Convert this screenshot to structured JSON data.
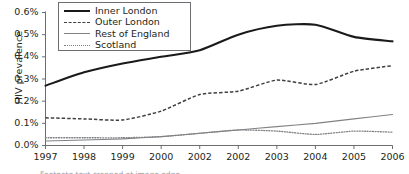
{
  "chart_data": {
    "type": "line",
    "title": "",
    "xlabel": "",
    "ylabel": "HIV prevalence",
    "x": [
      "1997",
      "1998",
      "1999",
      "2000",
      "2002",
      "2002",
      "2003",
      "2004",
      "2005",
      "2006"
    ],
    "xtick_labels": [
      "1997",
      "1998",
      "1999",
      "2000",
      "2002",
      "2002",
      "2003",
      "2004",
      "2005",
      "2006"
    ],
    "ytick_labels": [
      "0.0%",
      "0.1%",
      "0.2%",
      "0.3%",
      "0.4%",
      "0.5%",
      "0.6%"
    ],
    "ytick_values": [
      0.0,
      0.1,
      0.2,
      0.3,
      0.4,
      0.5,
      0.6
    ],
    "ylim": [
      0.0,
      0.6
    ],
    "yunit": "%",
    "grid": false,
    "legend_position": "top-left",
    "series": [
      {
        "name": "Inner London",
        "style": "solid-thick",
        "color": "#1a1a1a",
        "values": [
          0.27,
          0.33,
          0.37,
          0.4,
          0.43,
          0.5,
          0.54,
          0.545,
          0.49,
          0.47
        ]
      },
      {
        "name": "Outer London",
        "style": "dashed",
        "color": "#3f3f3f",
        "values": [
          0.125,
          0.12,
          0.115,
          0.155,
          0.23,
          0.245,
          0.295,
          0.275,
          0.335,
          0.36
        ]
      },
      {
        "name": "Rest of England",
        "style": "solid-thin",
        "color": "#808285",
        "values": [
          0.02,
          0.025,
          0.03,
          0.04,
          0.055,
          0.07,
          0.085,
          0.1,
          0.12,
          0.14
        ]
      },
      {
        "name": "Scotland",
        "style": "dotted",
        "color": "#808285",
        "values": [
          0.035,
          0.035,
          0.035,
          0.04,
          0.055,
          0.07,
          0.065,
          0.05,
          0.065,
          0.06
        ]
      }
    ]
  },
  "legend": {
    "items": [
      {
        "label": "Inner London",
        "style": "solid-thick"
      },
      {
        "label": "Outer London",
        "style": "dashed"
      },
      {
        "label": "Rest of England",
        "style": "solid-thin"
      },
      {
        "label": "Scotland",
        "style": "dotted"
      }
    ]
  },
  "footer": {
    "clipped_caption": "Footnote text cropped at image edge"
  }
}
